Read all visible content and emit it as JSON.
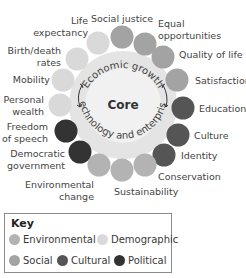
{
  "core": {
    "label": "Core",
    "ring_top": "Economic growth",
    "ring_bottom": "Technology and enterprise"
  },
  "colors": {
    "environmental": "#b3b3b3",
    "demographic": "#d9d9d9",
    "social": "#a3a3a3",
    "cultural": "#555555",
    "political": "#333333",
    "core_fill": "#efefef",
    "ring_fill": "#e2e2e2"
  },
  "factors": [
    {
      "label": "Life expectancy",
      "category": "demographic"
    },
    {
      "label": "Social justice",
      "category": "social"
    },
    {
      "label": "Equal opportunities",
      "category": "social"
    },
    {
      "label": "Quality of life",
      "category": "social"
    },
    {
      "label": "Satisfaction",
      "category": "social"
    },
    {
      "label": "Education",
      "category": "cultural"
    },
    {
      "label": "Culture",
      "category": "cultural"
    },
    {
      "label": "Identity",
      "category": "cultural"
    },
    {
      "label": "Conservation",
      "category": "environmental"
    },
    {
      "label": "Sustainability",
      "category": "environmental"
    },
    {
      "label": "Environmental change",
      "category": "environmental"
    },
    {
      "label": "Democratic government",
      "category": "political"
    },
    {
      "label": "Freedom of speech",
      "category": "political"
    },
    {
      "label": "Personal wealth",
      "category": "demographic"
    },
    {
      "label": "Mobility",
      "category": "demographic"
    },
    {
      "label": "Birth/death rates",
      "category": "demographic"
    }
  ],
  "key": {
    "title": "Key",
    "items": [
      {
        "label": "Environmental",
        "category": "environmental"
      },
      {
        "label": "Demographic",
        "category": "demographic"
      },
      {
        "label": "Social",
        "category": "social"
      },
      {
        "label": "Cultural",
        "category": "cultural"
      },
      {
        "label": "Political",
        "category": "political"
      }
    ]
  }
}
